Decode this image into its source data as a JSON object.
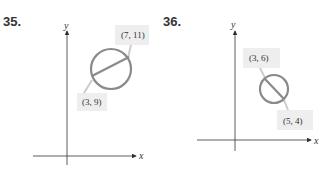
{
  "problems": [
    {
      "number": "35.",
      "axes": {
        "x_label": "x",
        "y_label": "y"
      },
      "circle": {
        "type": "circle with diameter"
      },
      "points": [
        {
          "label": "(7, 11)"
        },
        {
          "label": "(3, 9)"
        }
      ]
    },
    {
      "number": "36.",
      "axes": {
        "x_label": "x",
        "y_label": "y"
      },
      "circle": {
        "type": "circle with diameter"
      },
      "points": [
        {
          "label": "(3, 6)"
        },
        {
          "label": "(5, 4)"
        }
      ]
    }
  ],
  "colors": {
    "circle": "#8a8a8a",
    "axis": "#333333",
    "label_bg": "#eeeeee"
  }
}
